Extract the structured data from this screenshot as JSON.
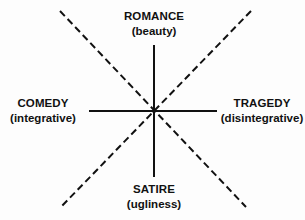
{
  "diagram": {
    "labels": {
      "top": {
        "title": "ROMANCE",
        "sub": "(beauty)"
      },
      "bottom": {
        "title": "SATIRE",
        "sub": "(ugliness)"
      },
      "left": {
        "title": "COMEDY",
        "sub": "(integrative)"
      },
      "right": {
        "title": "TRAGEDY",
        "sub": "(disintegrative)"
      }
    },
    "axes": {
      "vertical": {
        "style": "solid",
        "description": "Romance–Satire axis"
      },
      "horizontal": {
        "style": "solid",
        "description": "Comedy–Tragedy axis"
      },
      "diagonal_1": {
        "style": "dashed"
      },
      "diagonal_2": {
        "style": "dashed"
      }
    },
    "colors": {
      "ink": "#111111",
      "background": "#fdfdfd"
    }
  }
}
